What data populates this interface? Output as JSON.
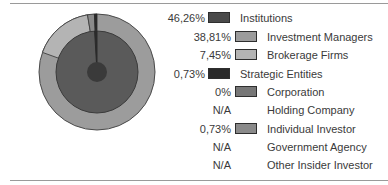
{
  "chart_data": {
    "type": "pie",
    "title": "",
    "legend_position": "right",
    "categories": [
      "Institutions",
      "Investment Managers",
      "Brokerage Firms",
      "Strategic Entities",
      "Corporation",
      "Holding Company",
      "Individual Investor",
      "Government Agency",
      "Other Insider Investor"
    ],
    "values_text": [
      "46,26%",
      "38,81%",
      "7,45%",
      "0,73%",
      "0%",
      "N/A",
      "0,73%",
      "N/A",
      "N/A"
    ],
    "values": [
      46.26,
      38.81,
      7.45,
      0.73,
      0,
      null,
      0.73,
      null,
      null
    ],
    "hierarchy": {
      "Institutions": [
        "Investment Managers",
        "Brokerage Firms"
      ],
      "Strategic Entities": [
        "Corporation",
        "Holding Company",
        "Individual Investor",
        "Government Agency",
        "Other Insider Investor"
      ]
    },
    "colors": {
      "Institutions": "#4a4a4a",
      "Investment Managers": "#9c9c9c",
      "Brokerage Firms": "#b4b4b4",
      "Strategic Entities": "#2a2a2a",
      "Corporation": "#777777",
      "Individual Investor": "#8a8a8a"
    }
  },
  "legend": {
    "rows": [
      {
        "value": "46,26%",
        "label": "Institutions",
        "level": 0,
        "swatch": "#4a4a4a"
      },
      {
        "value": "38,81%",
        "label": "Investment Managers",
        "level": 1,
        "swatch": "#9c9c9c"
      },
      {
        "value": "7,45%",
        "label": "Brokerage Firms",
        "level": 1,
        "swatch": "#b4b4b4"
      },
      {
        "value": "0,73%",
        "label": "Strategic Entities",
        "level": 0,
        "swatch": "#2a2a2a"
      },
      {
        "value": "0%",
        "label": "Corporation",
        "level": 1,
        "swatch": "#777777"
      },
      {
        "value": "N/A",
        "label": "Holding Company",
        "level": 1,
        "swatch": ""
      },
      {
        "value": "0,73%",
        "label": "Individual Investor",
        "level": 1,
        "swatch": "#8a8a8a"
      },
      {
        "value": "N/A",
        "label": "Government Agency",
        "level": 1,
        "swatch": ""
      },
      {
        "value": "N/A",
        "label": "Other Insider Investor",
        "level": 1,
        "swatch": ""
      }
    ]
  }
}
